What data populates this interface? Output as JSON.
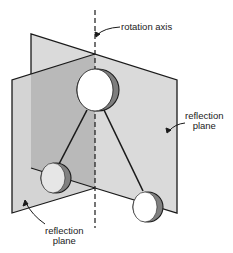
{
  "diagram": {
    "type": "molecular symmetry illustration",
    "labels": {
      "rotation_axis": "rotation axis",
      "reflection_plane_right_line1": "reflection",
      "reflection_plane_right_line2": "plane",
      "reflection_plane_left_line1": "reflection",
      "reflection_plane_left_line2": "plane"
    },
    "colors": {
      "plane_light": "#dcdcdc",
      "plane_dark": "#b8b8b8",
      "atom_fill": "#ffffff",
      "atom_shadow": "#808080",
      "stroke": "#1a1a1a"
    },
    "elements": [
      "central atom",
      "two terminal atoms",
      "two bonds",
      "two reflection planes",
      "rotation axis"
    ]
  }
}
